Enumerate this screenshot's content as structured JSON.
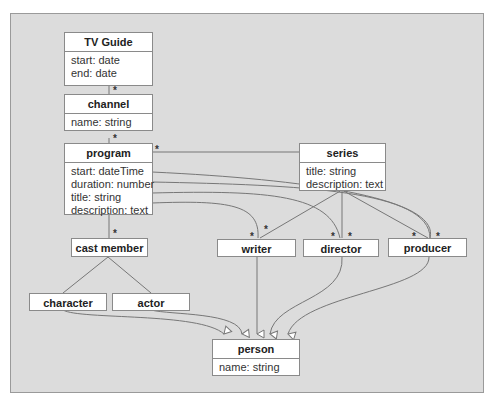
{
  "diagram": {
    "classes": {
      "tvguide": {
        "name": "TV Guide",
        "attrs": [
          "start: date",
          "end: date"
        ]
      },
      "channel": {
        "name": "channel",
        "attrs": [
          "name: string"
        ]
      },
      "program": {
        "name": "program",
        "attrs": [
          "start: dateTime",
          "duration: number",
          "title: string",
          "description: text"
        ]
      },
      "series": {
        "name": "series",
        "attrs": [
          "title: string",
          "description: text"
        ]
      },
      "castmember": {
        "name": "cast member"
      },
      "writer": {
        "name": "writer"
      },
      "director": {
        "name": "director"
      },
      "producer": {
        "name": "producer"
      },
      "character": {
        "name": "character"
      },
      "actor": {
        "name": "actor"
      },
      "person": {
        "name": "person",
        "attrs": [
          "name: string"
        ]
      }
    },
    "multiplicity": "*",
    "colors": {
      "background": "#dcdcdc",
      "box": "#ffffff",
      "line": "#777777"
    }
  }
}
